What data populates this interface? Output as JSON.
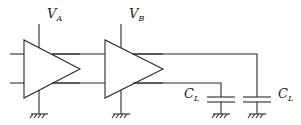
{
  "diagram": {
    "title": "",
    "labels": {
      "supply_a": {
        "main": "V",
        "sub": "A"
      },
      "supply_b": {
        "main": "V",
        "sub": "B"
      },
      "load_cap_1": {
        "main": "C",
        "sub": "L"
      },
      "load_cap_2": {
        "main": "C",
        "sub": "L"
      }
    },
    "components": [
      {
        "type": "amplifier",
        "name": "A",
        "supply": "V_A",
        "inputs": 2,
        "outputs": 2
      },
      {
        "type": "amplifier",
        "name": "B",
        "supply": "V_B",
        "inputs": 2,
        "outputs": 2
      },
      {
        "type": "capacitor",
        "name": "C_L",
        "connected_to": "B lower output"
      },
      {
        "type": "capacitor",
        "name": "C_L",
        "connected_to": "B upper output"
      }
    ],
    "colors": {
      "line": "#2b2b2b",
      "background": "#ffffff"
    }
  }
}
